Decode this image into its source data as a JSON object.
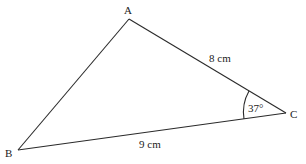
{
  "diagram": {
    "type": "triangle",
    "vertices": [
      {
        "id": "A",
        "label": "A",
        "x": 129,
        "y": 19,
        "label_x": 124,
        "label_y": 14
      },
      {
        "id": "B",
        "label": "B",
        "x": 18,
        "y": 150,
        "label_x": 5,
        "label_y": 157
      },
      {
        "id": "C",
        "label": "C",
        "x": 286,
        "y": 113,
        "label_x": 290,
        "label_y": 118
      }
    ],
    "sides": [
      {
        "from": "A",
        "to": "C",
        "label": "8 cm",
        "label_x": 209,
        "label_y": 62
      },
      {
        "from": "B",
        "to": "C",
        "label": "9 cm",
        "label_x": 139,
        "label_y": 148
      },
      {
        "from": "A",
        "to": "B",
        "label": ""
      }
    ],
    "angles": [
      {
        "at": "C",
        "label": "37°",
        "label_x": 248,
        "label_y": 112
      }
    ],
    "colors": {
      "stroke": "#2a2a2a",
      "text": "#222222",
      "background": "#ffffff"
    }
  }
}
